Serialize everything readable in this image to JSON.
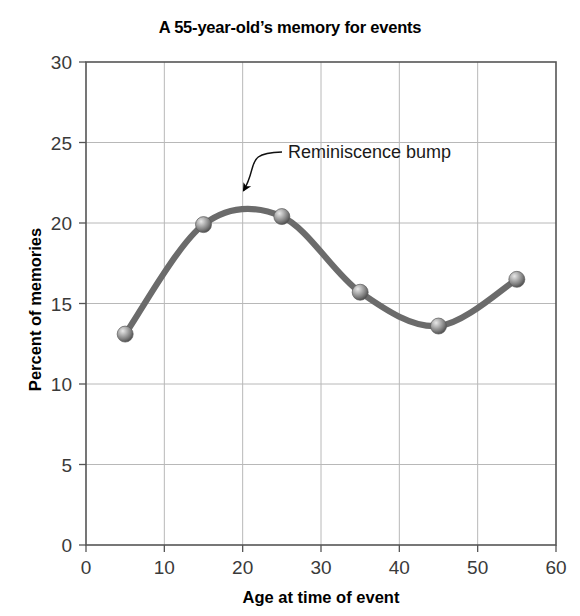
{
  "chart_data": {
    "type": "line",
    "title": "A 55-year-old’s memory for events",
    "xlabel": "Age at time of event",
    "ylabel": "Percent of memories",
    "x": [
      5,
      15,
      25,
      35,
      45,
      55
    ],
    "values": [
      13.1,
      19.9,
      20.4,
      15.7,
      13.6,
      16.5
    ],
    "series": [
      {
        "name": "Percent of memories",
        "values": [
          13.1,
          19.9,
          20.4,
          15.7,
          13.6,
          16.5
        ]
      }
    ],
    "xlim": [
      0,
      60
    ],
    "ylim": [
      0,
      30
    ],
    "xticks": [
      0,
      10,
      20,
      30,
      40,
      50,
      60
    ],
    "yticks": [
      0,
      5,
      10,
      15,
      20,
      25,
      30
    ],
    "xtick_labels": [
      "0",
      "10",
      "20",
      "30",
      "40",
      "50",
      "60"
    ],
    "ytick_labels": [
      "0",
      "5",
      "10",
      "15",
      "20",
      "25",
      "30"
    ],
    "grid": true,
    "legend": "none",
    "marker": "sphere",
    "line_color": "#6b6b6b",
    "marker_color": "#8a8a8a",
    "grid_color": "#b8b8b8",
    "axis_color": "#555555",
    "peak": {
      "x": 20,
      "y": 21.1
    },
    "annotations": [
      {
        "text": "Reminiscence bump",
        "label_x": 36,
        "label_y": 24.5,
        "points_to_x": 20,
        "points_to_y": 21.9
      }
    ]
  }
}
